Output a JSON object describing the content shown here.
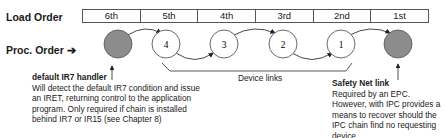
{
  "labels": {
    "load_order": "Load Order",
    "proc_order": "Proc. Order ➔"
  },
  "load_order_cells": [
    "6th",
    "5th",
    "4th",
    "3rd",
    "2nd",
    "1st"
  ],
  "nodes": [
    {
      "label": "",
      "type": "default-handler",
      "fill": "#8c8c8c"
    },
    {
      "label": "4",
      "type": "device",
      "fill": "#ffffff"
    },
    {
      "label": "3",
      "type": "device",
      "fill": "#ffffff"
    },
    {
      "label": "2",
      "type": "device",
      "fill": "#ffffff"
    },
    {
      "label": "1",
      "type": "device",
      "fill": "#ffffff"
    },
    {
      "label": "",
      "type": "safety-net",
      "fill": "#8c8c8c"
    }
  ],
  "device_links_label": "Device links",
  "notes": {
    "ir7": {
      "title": "default IR7 handler",
      "body": "Will detect the default IR7 condition and issue an IRET, returning control to the application program. Only required if chain is installed behind IR7 or IR15 (see Chapter 8)"
    },
    "safety": {
      "title": "Safety Net link",
      "body": "Required by an EPC. However, with IPC provides a means to recover should the IPC chain find no requesting device."
    }
  }
}
